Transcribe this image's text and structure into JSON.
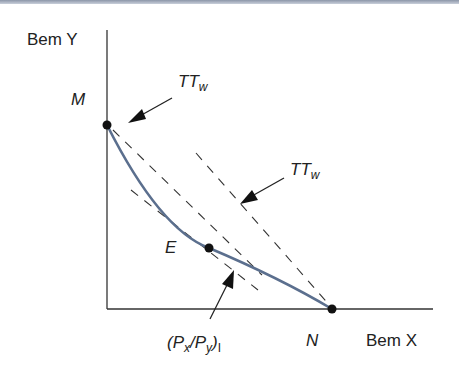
{
  "diagram": {
    "y_axis_label": "Bem Y",
    "x_axis_label": "Bem X",
    "points": {
      "M": "M",
      "N": "N",
      "E": "E"
    },
    "labels": {
      "tt_upper_main": "TT",
      "tt_upper_sub": "w",
      "tt_right_main": "TT",
      "tt_right_sub": "w",
      "price_open": "(P",
      "price_x_sub": "x",
      "price_slash": "/P",
      "price_y_sub": "y",
      "price_close": ")",
      "price_sub": "I"
    },
    "colors": {
      "curve": "#5b6f8e",
      "axes": "#333333",
      "dashes": "#333333",
      "top_border": "#8c96a8"
    }
  }
}
